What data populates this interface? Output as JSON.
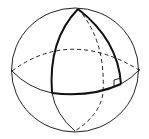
{
  "diagram": {
    "colors": {
      "background": "#ffffff",
      "stroke": "#222222",
      "bold_stroke": "#111111"
    },
    "elements": {
      "sphere_outline": "sphere-outline",
      "equator_front": "equator-front (solid)",
      "equator_back": "equator-back (dashed)",
      "meridian_hidden": "hidden meridian (dashed)",
      "triangle": "spherical triangle (bold)",
      "right_angle_marker": "right-angle marker"
    }
  }
}
